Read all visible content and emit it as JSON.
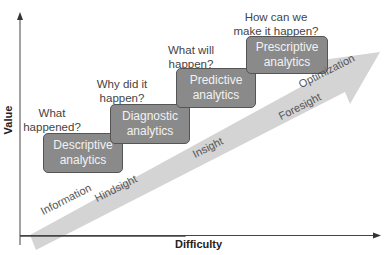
{
  "diagram": {
    "axes": {
      "x_label": "Difficulty",
      "y_label": "Value"
    },
    "stages": [
      {
        "box": "Descriptive analytics",
        "line1": "Descriptive",
        "line2": "analytics",
        "question_line1": "What",
        "question_line2": "happened?"
      },
      {
        "box": "Diagnostic analytics",
        "line1": "Diagnostic",
        "line2": "analytics",
        "question_line1": "Why did it",
        "question_line2": "happen?"
      },
      {
        "box": "Predictive analytics",
        "line1": "Predictive",
        "line2": "analytics",
        "question_line1": "What will",
        "question_line2": "happen?"
      },
      {
        "box": "Prescriptive analytics",
        "line1": "Prescriptive",
        "line2": "analytics",
        "question_line1": "How can we",
        "question_line2": "make it happen?"
      }
    ],
    "arrow_labels": [
      "Information",
      "Optimization"
    ],
    "below_arrow_labels": [
      "Hindsight",
      "Insight",
      "Foresight"
    ],
    "colors": {
      "box_fill": "#8a8a8a",
      "arrow_fill": "#d4d4d4",
      "text": "#444444"
    }
  }
}
